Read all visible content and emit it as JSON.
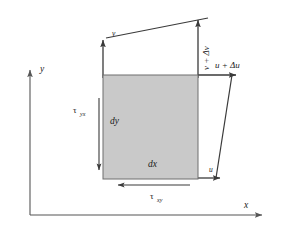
{
  "figure": {
    "kind": "engineering-diagram",
    "colors": {
      "element_fill": "#c9c9c9",
      "element_stroke": "#555555",
      "line": "#3a3a3a",
      "axis": "#555555",
      "text": "#1a1a1a",
      "background": "#ffffff"
    }
  },
  "axes": {
    "y_label": "y",
    "x_label": "x"
  },
  "element": {
    "width_label": "dx",
    "height_label": "dy"
  },
  "displacements": {
    "v_left": "v",
    "v_right_prefix": "v + ",
    "v_right_delta": "Δv",
    "v_right_full": "v + Δv",
    "u_bottom": "u",
    "u_top_prefix": "u + ",
    "u_top_delta": "Δu",
    "u_top_full": "u + Δu"
  },
  "stresses": {
    "tau_yx": {
      "symbol": "τ",
      "subscript": "yx",
      "full": "τyx"
    },
    "tau_xy": {
      "symbol": "τ",
      "subscript": "xy",
      "full": "τxy"
    }
  }
}
